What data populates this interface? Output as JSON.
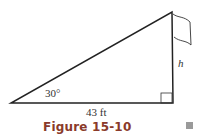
{
  "figure": {
    "caption": "Figure 15-10",
    "angle_label": "30°",
    "base_label": "43 ft",
    "height_label": "h",
    "caption_color": "#8a3a2a",
    "line_color": "#222222"
  }
}
